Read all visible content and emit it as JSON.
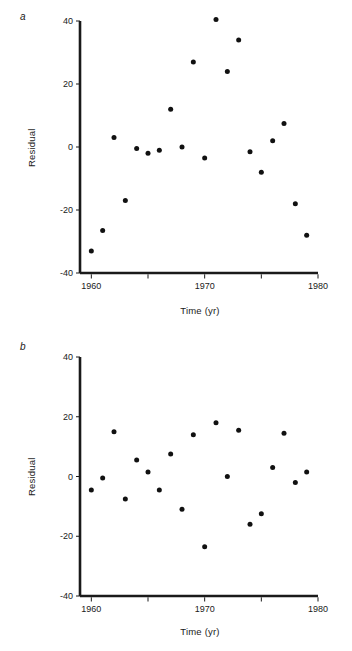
{
  "figure": {
    "background": "#ffffff",
    "marker_color": "#111111",
    "axis_color": "#1a1a1a"
  },
  "panels": [
    {
      "id": "a",
      "label": "a",
      "chart_data": {
        "type": "scatter",
        "title": "",
        "xlabel": "Time (yr)",
        "ylabel": "Residual",
        "xlim": [
          1959,
          1980
        ],
        "ylim": [
          -40,
          40
        ],
        "xticks": [
          1960,
          1965,
          1970,
          1975,
          1980
        ],
        "xticklabels": [
          "1960",
          "",
          "1970",
          "",
          "1980"
        ],
        "yticks": [
          -40,
          -20,
          0,
          20,
          40
        ],
        "yticklabels": [
          "-40",
          "-20",
          "0",
          "20",
          "40"
        ],
        "grid": false,
        "legend": "none",
        "x": [
          1960,
          1961,
          1962,
          1963,
          1964,
          1965,
          1966,
          1967,
          1968,
          1969,
          1970,
          1971,
          1972,
          1973,
          1974,
          1975,
          1976,
          1977,
          1978,
          1979
        ],
        "y": [
          -33,
          -26.5,
          3,
          -17,
          -0.5,
          -2,
          -1,
          12,
          0,
          27,
          -3.5,
          40.5,
          24,
          34,
          -1.5,
          -8,
          2,
          7.5,
          -18,
          -28
        ]
      }
    },
    {
      "id": "b",
      "label": "b",
      "chart_data": {
        "type": "scatter",
        "title": "",
        "xlabel": "Time (yr)",
        "ylabel": "Residual",
        "xlim": [
          1959,
          1980
        ],
        "ylim": [
          -40,
          40
        ],
        "xticks": [
          1960,
          1965,
          1970,
          1975,
          1980
        ],
        "xticklabels": [
          "1960",
          "",
          "1970",
          "",
          "1980"
        ],
        "yticks": [
          -40,
          -20,
          0,
          20,
          40
        ],
        "yticklabels": [
          "-40",
          "-20",
          "0",
          "20",
          "40"
        ],
        "grid": false,
        "legend": "none",
        "x": [
          1960,
          1961,
          1962,
          1963,
          1964,
          1965,
          1966,
          1967,
          1968,
          1969,
          1970,
          1971,
          1972,
          1973,
          1974,
          1975,
          1976,
          1977,
          1978,
          1979
        ],
        "y": [
          -4.5,
          -0.5,
          15,
          -7.5,
          5.5,
          1.5,
          -4.5,
          7.5,
          -11,
          14,
          -23.5,
          18,
          0,
          15.5,
          -16,
          -12.5,
          3,
          14.5,
          -2,
          1.5
        ]
      }
    }
  ]
}
